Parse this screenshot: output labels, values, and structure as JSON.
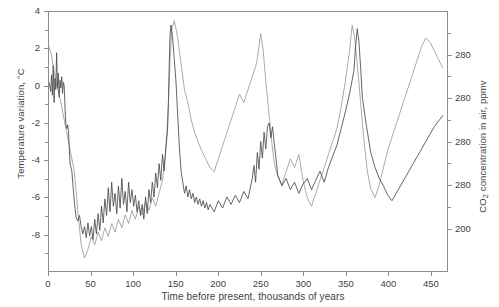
{
  "chart_data": {
    "type": "line",
    "title": "",
    "xlabel": "Time before present, thousands of years",
    "ylabel_left": "Temperature variation, °C",
    "ylabel_right": "CO₂ concentration in air, ppmv",
    "ylabel_right_main": "concentration in air, ppmv",
    "ylabel_right_prefix": "CO",
    "ylabel_right_sub": "2",
    "xlim": [
      0,
      470
    ],
    "ylim_left": [
      -10,
      4
    ],
    "ylim_right": [
      180,
      300
    ],
    "grid": false,
    "legend": "none",
    "xticks": [
      0,
      50,
      100,
      150,
      200,
      250,
      300,
      350,
      400,
      450
    ],
    "xtick_labels": [
      "0",
      "50",
      "100",
      "150",
      "200",
      "250",
      "300",
      "350",
      "400",
      "450"
    ],
    "yticks_left": [
      4,
      2,
      0,
      -2,
      -4,
      -6,
      -8
    ],
    "ytick_labels_left": [
      "4",
      "2",
      "0",
      "-2",
      "-4",
      "-6",
      "-8"
    ],
    "yticks_right": [
      280,
      260,
      240,
      220,
      200
    ],
    "ytick_labels_right": [
      "280",
      "280",
      "280",
      "280",
      "200"
    ],
    "ytick_minor_right": [
      290,
      270,
      250,
      230,
      210
    ],
    "series": [
      {
        "name": "Temperature variation",
        "axis": "left",
        "color": "#4a4a4a",
        "units": "°C",
        "x": [
          0,
          2,
          3,
          4,
          5,
          6,
          7,
          8,
          9,
          10,
          11,
          12,
          13,
          14,
          15,
          16,
          17,
          18,
          19,
          20,
          21,
          22,
          23,
          24,
          25,
          26,
          27,
          28,
          30,
          32,
          34,
          36,
          38,
          40,
          42,
          44,
          46,
          48,
          50,
          52,
          54,
          56,
          58,
          60,
          62,
          64,
          66,
          68,
          70,
          72,
          74,
          76,
          78,
          80,
          82,
          84,
          86,
          88,
          90,
          92,
          94,
          96,
          98,
          100,
          102,
          104,
          106,
          108,
          110,
          112,
          114,
          116,
          118,
          120,
          122,
          124,
          126,
          128,
          130,
          132,
          134,
          136,
          138,
          140,
          141,
          142,
          143,
          144,
          146,
          148,
          150,
          152,
          154,
          156,
          158,
          160,
          162,
          164,
          166,
          168,
          170,
          172,
          174,
          176,
          178,
          180,
          182,
          184,
          186,
          188,
          190,
          195,
          200,
          205,
          210,
          215,
          220,
          225,
          230,
          235,
          240,
          242,
          244,
          246,
          248,
          250,
          252,
          254,
          256,
          258,
          260,
          262,
          264,
          266,
          268,
          270,
          275,
          280,
          285,
          290,
          295,
          300,
          305,
          310,
          315,
          320,
          325,
          330,
          335,
          340,
          345,
          350,
          355,
          360,
          362,
          364,
          366,
          368,
          370,
          375,
          380,
          385,
          390,
          395,
          400,
          405,
          410,
          415,
          420,
          425,
          430,
          435,
          440,
          445,
          450,
          455,
          460,
          465
        ],
        "y": [
          0.2,
          -0.3,
          0.6,
          -0.5,
          1.1,
          -0.9,
          0.4,
          -0.2,
          1.8,
          -0.1,
          0.7,
          -0.6,
          0.3,
          -0.1,
          0.5,
          -0.4,
          0.2,
          0,
          -1.3,
          -2.1,
          -2.3,
          -2.1,
          -2.4,
          -3.5,
          -4.2,
          -4.4,
          -4.6,
          -5.2,
          -6.3,
          -7.1,
          -7.3,
          -7.0,
          -7.6,
          -8.0,
          -7.6,
          -8.2,
          -7.4,
          -8.1,
          -7.6,
          -8.3,
          -7.2,
          -8.0,
          -6.9,
          -7.8,
          -6.5,
          -7.4,
          -6.1,
          -7.0,
          -5.5,
          -6.8,
          -5.2,
          -6.5,
          -5.8,
          -6.9,
          -5.4,
          -6.6,
          -5.0,
          -6.4,
          -5.7,
          -6.8,
          -5.2,
          -6.3,
          -5.6,
          -6.5,
          -5.9,
          -6.8,
          -6.2,
          -7.0,
          -6.4,
          -7.2,
          -6.0,
          -6.9,
          -5.6,
          -6.3,
          -5.2,
          -6.0,
          -4.7,
          -5.5,
          -4.2,
          -5.1,
          -3.7,
          -4.6,
          -3.3,
          -2.4,
          -1.0,
          1.2,
          2.8,
          3.3,
          2.6,
          1.4,
          0.2,
          -1.6,
          -3.3,
          -4.6,
          -5.2,
          -5.8,
          -5.4,
          -6.0,
          -5.6,
          -6.1,
          -5.8,
          -6.3,
          -6.0,
          -6.4,
          -6.1,
          -6.5,
          -6.2,
          -6.6,
          -6.3,
          -6.7,
          -6.4,
          -6.8,
          -6.2,
          -6.6,
          -6.0,
          -6.4,
          -5.9,
          -6.3,
          -5.7,
          -6.1,
          -5.0,
          -4.3,
          -5.2,
          -3.6,
          -4.5,
          -3.0,
          -3.9,
          -2.5,
          -3.4,
          -2.2,
          -2.0,
          -2.8,
          -2.2,
          -3.1,
          -3.9,
          -4.8,
          -5.4,
          -5.0,
          -5.6,
          -5.2,
          -5.8,
          -5.3,
          -5.0,
          -5.6,
          -5.1,
          -4.6,
          -5.2,
          -4.4,
          -3.8,
          -3.2,
          -2.3,
          -1.4,
          -0.4,
          0.8,
          2.1,
          3.1,
          2.4,
          1.0,
          -0.6,
          -2.2,
          -3.6,
          -4.4,
          -5.0,
          -5.4,
          -5.9,
          -6.2,
          -5.8,
          -5.4,
          -5.0,
          -4.6,
          -4.2,
          -3.8,
          -3.4,
          -3.0,
          -2.6,
          -2.2,
          -1.9,
          -1.6
        ]
      },
      {
        "name": "CO2 concentration",
        "axis": "right",
        "color": "#9a9a9a",
        "units": "ppmv",
        "x": [
          0,
          3,
          6,
          9,
          12,
          15,
          18,
          21,
          24,
          27,
          30,
          34,
          38,
          42,
          46,
          50,
          54,
          58,
          62,
          66,
          70,
          74,
          78,
          82,
          86,
          90,
          94,
          98,
          102,
          106,
          110,
          114,
          118,
          122,
          126,
          130,
          134,
          138,
          141,
          143,
          145,
          148,
          152,
          156,
          160,
          164,
          168,
          172,
          176,
          180,
          185,
          190,
          195,
          200,
          205,
          210,
          215,
          220,
          225,
          230,
          235,
          240,
          245,
          248,
          250,
          253,
          256,
          260,
          263,
          266,
          270,
          275,
          280,
          285,
          290,
          295,
          300,
          305,
          310,
          315,
          320,
          325,
          330,
          335,
          340,
          345,
          350,
          355,
          358,
          361,
          364,
          368,
          372,
          376,
          380,
          385,
          390,
          395,
          400,
          405,
          410,
          415,
          420,
          425,
          430,
          435,
          440,
          445,
          450,
          455,
          460,
          465
        ],
        "y": [
          284,
          280,
          272,
          266,
          262,
          256,
          250,
          244,
          238,
          232,
          226,
          208,
          192,
          186,
          190,
          196,
          192,
          198,
          194,
          200,
          196,
          202,
          198,
          204,
          200,
          206,
          202,
          208,
          204,
          210,
          206,
          212,
          208,
          214,
          210,
          216,
          222,
          236,
          258,
          278,
          292,
          296,
          288,
          276,
          264,
          258,
          250,
          244,
          240,
          236,
          232,
          228,
          226,
          232,
          238,
          244,
          250,
          256,
          262,
          258,
          264,
          270,
          276,
          284,
          290,
          282,
          268,
          252,
          240,
          230,
          224,
          220,
          226,
          232,
          228,
          234,
          222,
          214,
          210,
          216,
          222,
          228,
          234,
          240,
          246,
          256,
          268,
          282,
          294,
          288,
          276,
          258,
          240,
          226,
          218,
          214,
          220,
          228,
          236,
          242,
          248,
          254,
          260,
          266,
          272,
          278,
          284,
          288,
          286,
          282,
          278,
          274
        ]
      }
    ]
  }
}
